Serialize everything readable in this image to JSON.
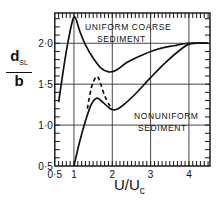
{
  "chart_data": {
    "type": "line",
    "title": "",
    "xlabel": "U/Uc",
    "ylabel": "dSL/b",
    "xlim": [
      0.5,
      4.55
    ],
    "ylim": [
      0.5,
      2.37
    ],
    "grid": true,
    "xticks": [
      {
        "value": 0.5,
        "label": "0·5"
      },
      {
        "value": 1,
        "label": "1"
      },
      {
        "value": 2,
        "label": "2"
      },
      {
        "value": 3,
        "label": "3"
      },
      {
        "value": 4,
        "label": "4"
      }
    ],
    "yticks": [
      {
        "value": 0.5,
        "label": "0·5"
      },
      {
        "value": 1.0,
        "label": "1·0"
      },
      {
        "value": 1.5,
        "label": "1·5"
      },
      {
        "value": 2.0,
        "label": "2·0"
      }
    ],
    "series": [
      {
        "name": "Uniform coarse sediment",
        "style": "solid",
        "x": [
          0.6,
          0.7,
          0.8,
          0.9,
          0.97,
          1.0,
          1.05,
          1.15,
          1.3,
          1.5,
          1.7,
          1.9,
          2.1,
          2.4,
          2.8,
          3.2,
          3.6,
          4.0,
          4.5
        ],
        "y": [
          1.28,
          1.6,
          1.9,
          2.15,
          2.29,
          2.32,
          2.3,
          2.15,
          1.98,
          1.82,
          1.7,
          1.65,
          1.67,
          1.77,
          1.86,
          1.93,
          1.97,
          2.0,
          2.0
        ]
      },
      {
        "name": "Nonuniform sediment",
        "style": "solid",
        "x": [
          1.0,
          1.15,
          1.3,
          1.45,
          1.6,
          1.75,
          1.95,
          2.1,
          2.3,
          2.6,
          3.0,
          3.4,
          3.8,
          4.0,
          4.2,
          4.5
        ],
        "y": [
          0.5,
          0.8,
          1.05,
          1.25,
          1.33,
          1.28,
          1.2,
          1.19,
          1.25,
          1.38,
          1.58,
          1.77,
          1.93,
          1.99,
          2.0,
          2.0
        ]
      },
      {
        "name": "Nonuniform sediment (dashed branch)",
        "style": "dashed",
        "x": [
          1.35,
          1.45,
          1.55,
          1.62,
          1.7,
          1.8,
          1.95
        ],
        "y": [
          1.2,
          1.45,
          1.57,
          1.59,
          1.5,
          1.36,
          1.22
        ]
      }
    ],
    "annotations": [
      {
        "text_line1": "UNIFORM  COARSE",
        "text_line2": "SEDIMENT",
        "near_series": "Uniform coarse sediment"
      },
      {
        "text_line1": "NONUNIFORM",
        "text_line2": "SEDIMENT",
        "near_series": "Nonuniform sediment"
      }
    ]
  },
  "labels": {
    "y_num": "d",
    "y_sub": "SL",
    "y_den": "b",
    "x_num": "U",
    "x_den": "U",
    "x_den_sub": "c",
    "annot_uniform_1": "UNIFORM  COARSE",
    "annot_uniform_2": "SEDIMENT",
    "annot_nonuniform_1": "NONUNIFORM",
    "annot_nonuniform_2": "SEDIMENT"
  },
  "colors": {
    "line": "#111111",
    "grid": "#333333",
    "background": "#ffffff"
  }
}
